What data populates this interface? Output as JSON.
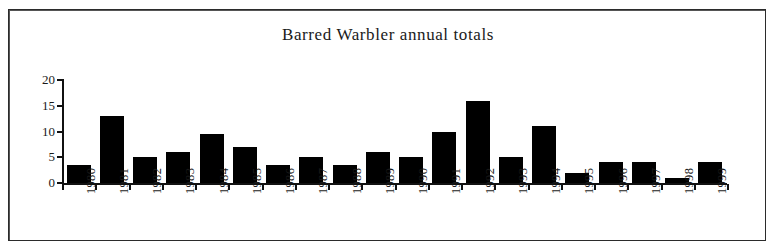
{
  "figure": {
    "title": "Barred Warbler annual totals",
    "background_color": "#ffffff",
    "frame_color": "#2b2b2b",
    "bar_color": "#000000",
    "axis_color": "#111111"
  },
  "chart_data": {
    "type": "bar",
    "title": "Barred Warbler annual totals",
    "xlabel": "",
    "ylabel": "",
    "categories": [
      "1980",
      "1981",
      "1982",
      "1983",
      "1984",
      "1985",
      "1986",
      "1987",
      "1988",
      "1989",
      "1990",
      "1991",
      "1992",
      "1993",
      "1994",
      "1995",
      "1996",
      "1997",
      "1998",
      "1999"
    ],
    "values": [
      3.5,
      13,
      5,
      6,
      9.5,
      7,
      3.5,
      5,
      3.5,
      6,
      5,
      10,
      16,
      5,
      11,
      2,
      4,
      4,
      1,
      4
    ],
    "ylim": [
      0,
      20
    ],
    "yticks": [
      0,
      5,
      10,
      15,
      20
    ],
    "ytick_labels": [
      "0",
      "5",
      "10",
      "15",
      "20"
    ],
    "grid": false,
    "legend": null,
    "legend_position": "none",
    "bar_color": "#000000",
    "x_tick_label_rotation": 90
  }
}
